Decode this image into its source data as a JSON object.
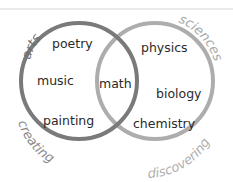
{
  "diagram": {
    "type": "venn",
    "sets": [
      {
        "id": "left",
        "top_label": "arts",
        "bottom_label": "creating",
        "color": "#7a7a7a",
        "label_color": "#6e6e6e",
        "items": [
          "poetry",
          "music",
          "painting"
        ]
      },
      {
        "id": "right",
        "top_label": "sciences",
        "bottom_label": "discovering",
        "color": "#adadad",
        "label_color": "#a8a8a8",
        "items": [
          "physics",
          "biology",
          "chemistry"
        ]
      }
    ],
    "intersection": {
      "items": [
        "math"
      ]
    }
  }
}
